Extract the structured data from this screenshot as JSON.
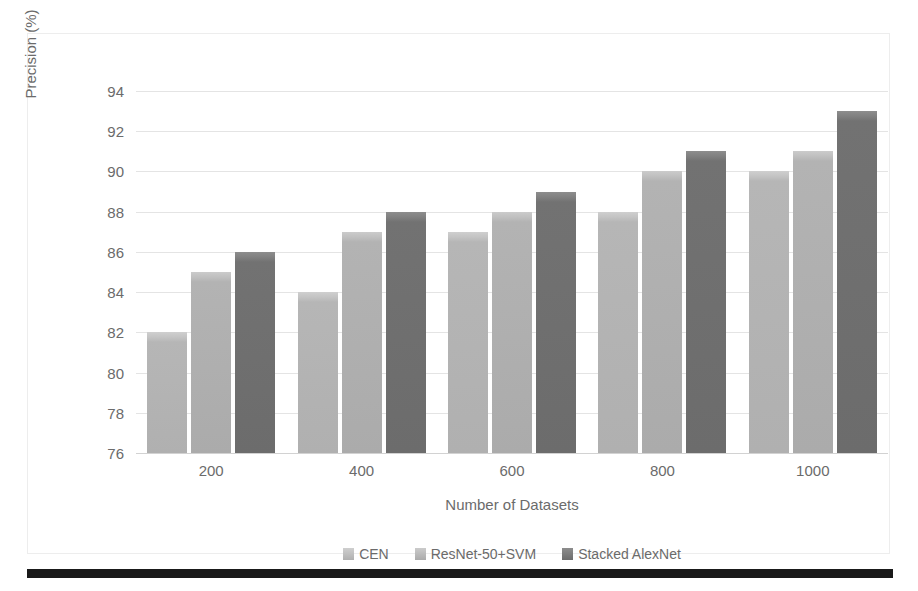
{
  "chart_data": {
    "type": "bar",
    "title": "",
    "xlabel": "Number of Datasets",
    "ylabel": "Precision (%)",
    "categories": [
      "200",
      "400",
      "600",
      "800",
      "1000"
    ],
    "series": [
      {
        "name": "CEN",
        "values": [
          82,
          84,
          87,
          88,
          90
        ],
        "color": "#b0b0b0"
      },
      {
        "name": "ResNet-50+SVM",
        "values": [
          85,
          87,
          88,
          90,
          91
        ],
        "color": "#ababab"
      },
      {
        "name": "Stacked AlexNet",
        "values": [
          86,
          88,
          89,
          91,
          93
        ],
        "color": "#6c6c6c"
      }
    ],
    "ylim": [
      76,
      94
    ],
    "ytick_step": 2,
    "yticks": [
      "94",
      "92",
      "90",
      "88",
      "86",
      "84",
      "82",
      "80",
      "78",
      "76"
    ],
    "grid": true,
    "legend_position": "bottom"
  },
  "axes": {
    "y_title": "Precision (%)",
    "x_title": "Number of Datasets"
  },
  "legend": {
    "items": [
      {
        "label": "CEN"
      },
      {
        "label": "ResNet-50+SVM"
      },
      {
        "label": "Stacked AlexNet"
      }
    ]
  },
  "colors": {
    "series_1": "#b0b0b0",
    "series_2": "#ababab",
    "series_3": "#6c6c6c",
    "gridline": "#e4e4e4",
    "tick_text": "#6b6b6b",
    "frame": "#ededed",
    "rule": "#1a1a1a"
  }
}
